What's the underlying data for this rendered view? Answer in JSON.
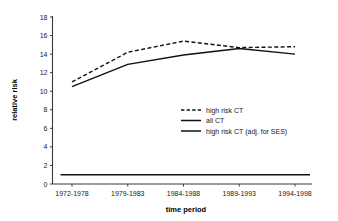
{
  "chart_data": {
    "type": "line",
    "title": "",
    "subtitle": "",
    "xlabel": "time period",
    "ylabel": "relative risk",
    "categories": [
      "1972-1978",
      "1979-1983",
      "1984-1988",
      "1989-1993",
      "1994-1998"
    ],
    "ylim": [
      0,
      18
    ],
    "yticks": [
      0,
      2,
      4,
      6,
      8,
      10,
      12,
      14,
      16,
      18
    ],
    "ytick_labels": [
      "0",
      "2",
      "4",
      "6",
      "8",
      "10",
      "12",
      "14",
      "16",
      "18"
    ],
    "grid": false,
    "legend_position": "center-right inside plot",
    "series": [
      {
        "name": "high risk CT",
        "style": "dashed",
        "color": "#111111",
        "values": [
          11.0,
          14.2,
          15.4,
          14.7,
          14.8
        ]
      },
      {
        "name": "all CT",
        "style": "solid",
        "color": "#111111",
        "values": [
          1.0,
          1.0,
          1.0,
          1.0,
          1.0
        ]
      },
      {
        "name": "high risk CT (adj. for SES)",
        "style": "solid",
        "color": "#111111",
        "values": [
          10.5,
          12.9,
          13.9,
          14.6,
          14.0
        ]
      }
    ]
  },
  "legend": {
    "entries": [
      {
        "label": "high risk CT",
        "style": "dashed"
      },
      {
        "label": "all CT",
        "style": "solid"
      },
      {
        "label": "high risk CT (adj. for SES)",
        "style": "solid"
      }
    ]
  },
  "axes": {
    "y_title": "relative risk",
    "x_title": "time period"
  }
}
